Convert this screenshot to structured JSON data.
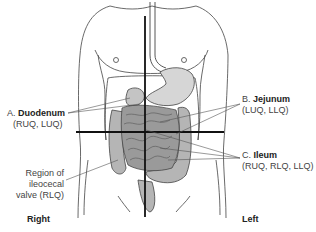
{
  "figure": {
    "colors": {
      "outline": "#333333",
      "intestine_fill": "#a8a8a8",
      "intestine_dark": "#6e6e6e",
      "cross_lines": "#111111",
      "background": "#ffffff"
    }
  },
  "labels": {
    "a": {
      "prefix": "A.",
      "name": "Duodenum",
      "quadrants": "(RUQ, LUQ)"
    },
    "b": {
      "prefix": "B.",
      "name": "Jejunum",
      "quadrants": "(LUQ, LLQ)"
    },
    "c": {
      "prefix": "C.",
      "name": "Ileum",
      "quadrants": "(RUQ, RLQ, LLQ)"
    },
    "region": {
      "line1": "Region of",
      "line2": "ileocecal",
      "line3": "valve (RLQ)"
    }
  },
  "sides": {
    "right": "Right",
    "left": "Left"
  }
}
